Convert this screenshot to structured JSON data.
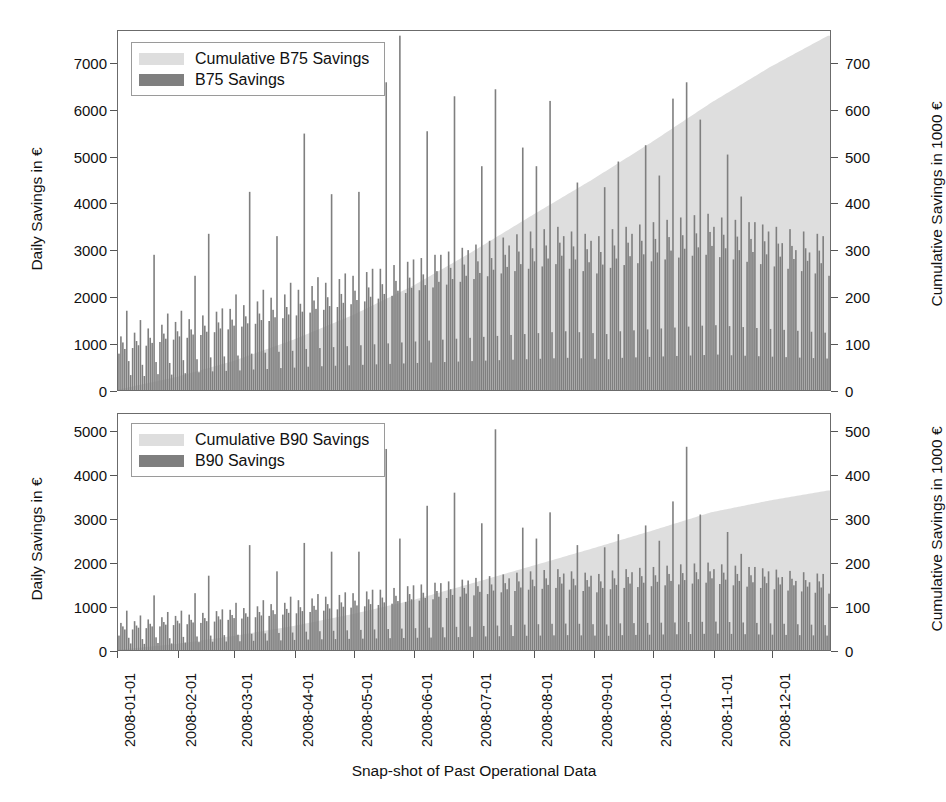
{
  "figure": {
    "width": 937,
    "height": 802,
    "background": "#ffffff",
    "xlabel": "Snap-shot of Past Operational Data"
  },
  "colors": {
    "bar": "#7f7f7f",
    "cumulative_area": "#dedede",
    "frame": "#6b6b6b",
    "text": "#111111"
  },
  "xaxis": {
    "label": "Snap-shot of Past Operational Data",
    "ticks": [
      "2008-01-01",
      "2008-02-01",
      "2008-03-01",
      "2008-04-01",
      "2008-05-01",
      "2008-06-01",
      "2008-07-01",
      "2008-08-01",
      "2008-09-01",
      "2008-10-01",
      "2008-11-01",
      "2008-12-01"
    ],
    "tick_day_offsets": [
      0,
      31,
      60,
      91,
      121,
      152,
      182,
      213,
      244,
      274,
      305,
      335
    ],
    "range_days": [
      0,
      365
    ]
  },
  "panels": [
    {
      "id": "b75",
      "legend": {
        "items": [
          {
            "label": "Cumulative B75 Savings",
            "color": "#dedede",
            "name": "legend-cumulative-b75"
          },
          {
            "label": "B75 Savings",
            "color": "#7f7f7f",
            "name": "legend-b75"
          }
        ]
      },
      "ylabel_left": "Daily Savings in €",
      "ylabel_right": "Cumulative Savings in 1000 €",
      "yticks_left": [
        0,
        1000,
        2000,
        3000,
        4000,
        5000,
        6000,
        7000
      ],
      "yticks_right": [
        0,
        100,
        200,
        300,
        400,
        500,
        600,
        700
      ],
      "ylim_left": [
        0,
        7700
      ],
      "ylim_right": [
        0,
        770
      ]
    },
    {
      "id": "b90",
      "legend": {
        "items": [
          {
            "label": "Cumulative B90 Savings",
            "color": "#dedede",
            "name": "legend-cumulative-b90"
          },
          {
            "label": "B90 Savings",
            "color": "#7f7f7f",
            "name": "legend-b90"
          }
        ]
      },
      "ylabel_left": "Daily Savings in €",
      "ylabel_right": "Cumulative Savings in 1000 €",
      "yticks_left": [
        0,
        1000,
        2000,
        3000,
        4000,
        5000
      ],
      "yticks_right": [
        0,
        100,
        200,
        300,
        400,
        500
      ],
      "ylim_left": [
        0,
        5400
      ],
      "ylim_right": [
        0,
        540
      ]
    }
  ],
  "chart_data": [
    {
      "type": "bar",
      "id": "b75",
      "title": "",
      "xlabel": "Snap-shot of Past Operational Data",
      "ylabel": "Daily Savings in €",
      "ylabel_secondary": "Cumulative Savings in 1000 €",
      "ylim": [
        0,
        7700
      ],
      "ylim_secondary": [
        0,
        770
      ],
      "grid": false,
      "legend_position": "upper left",
      "x_start_date": "2008-01-01",
      "x_end_date": "2008-12-31",
      "n_points": 365,
      "series": [
        {
          "name": "B75 Savings",
          "kind": "bar",
          "color": "#7f7f7f",
          "axis": "left",
          "unit": "€ per day",
          "note": "Daily savings, strong weekly pattern: weekday peaks, weekend troughs. Mean rises from ~900 in January to ~2900 in December.",
          "monthly_mean": [
            950,
            1200,
            1500,
            1750,
            2050,
            2400,
            2550,
            2500,
            2650,
            2800,
            2700,
            2600
          ],
          "monthly_max": [
            2900,
            3400,
            4250,
            5500,
            7600,
            6300,
            6450,
            6200,
            5100,
            6600,
            5050,
            3450
          ],
          "monthly_min": [
            150,
            200,
            250,
            300,
            350,
            400,
            450,
            420,
            450,
            480,
            450,
            420
          ],
          "values": [
            780,
            1150,
            1020,
            880,
            1700,
            620,
            320,
            900,
            1230,
            1050,
            960,
            1500,
            540,
            300,
            950,
            1320,
            1120,
            1010,
            2900,
            600,
            340,
            1030,
            1400,
            1210,
            1100,
            1640,
            580,
            330,
            1080,
            1460,
            1260,
            1150,
            1700,
            640,
            360,
            1120,
            1520,
            1300,
            1190,
            2450,
            660,
            380,
            1180,
            1600,
            1380,
            1250,
            3350,
            700,
            400,
            1240,
            1680,
            1450,
            1320,
            1750,
            720,
            410,
            1300,
            1740,
            1510,
            1380,
            2050,
            740,
            420,
            1360,
            1820,
            1580,
            1430,
            4250,
            780,
            440,
            1420,
            1900,
            1640,
            1500,
            2150,
            800,
            450,
            1480,
            1980,
            1720,
            1560,
            3300,
            820,
            470,
            1540,
            2050,
            1780,
            1620,
            2300,
            840,
            480,
            1600,
            2150,
            1850,
            1680,
            5500,
            880,
            500,
            1660,
            2230,
            1920,
            1740,
            2420,
            900,
            510,
            1720,
            2300,
            1990,
            1800,
            4200,
            920,
            520,
            1780,
            2380,
            2060,
            1870,
            2500,
            940,
            530,
            1840,
            2450,
            2130,
            1930,
            4250,
            960,
            540,
            1900,
            2530,
            2200,
            2000,
            2600,
            980,
            550,
            1960,
            2600,
            2270,
            2060,
            6600,
            1000,
            560,
            2020,
            2680,
            2340,
            2130,
            7600,
            1020,
            570,
            2080,
            2750,
            2410,
            2190,
            2800,
            1040,
            580,
            2140,
            2830,
            2480,
            2250,
            5550,
            1060,
            590,
            2200,
            2900,
            2550,
            2320,
            2900,
            1080,
            600,
            2260,
            2970,
            2620,
            2380,
            6300,
            1100,
            610,
            2320,
            3050,
            2690,
            2450,
            3000,
            1120,
            620,
            2380,
            3120,
            2760,
            2510,
            4800,
            1140,
            630,
            2440,
            3200,
            2830,
            2580,
            6450,
            1160,
            640,
            2500,
            3270,
            2900,
            2640,
            3100,
            1180,
            650,
            2550,
            3340,
            2970,
            2700,
            5200,
            1200,
            660,
            2600,
            3400,
            3040,
            2760,
            4800,
            1220,
            670,
            2650,
            3450,
            3100,
            2820,
            6200,
            1240,
            680,
            2700,
            3500,
            3160,
            2880,
            3300,
            1260,
            690,
            2600,
            3400,
            3080,
            2800,
            4450,
            1240,
            680,
            2550,
            3350,
            3020,
            2740,
            3200,
            1220,
            670,
            2500,
            3300,
            2960,
            2690,
            4350,
            1200,
            660,
            2620,
            3450,
            3100,
            2820,
            4900,
            1260,
            690,
            2680,
            3500,
            3160,
            2870,
            3350,
            1280,
            700,
            2720,
            3550,
            3200,
            2910,
            5250,
            1300,
            710,
            2760,
            3600,
            3240,
            2950,
            4600,
            1320,
            720,
            2800,
            3650,
            3280,
            2990,
            6250,
            1340,
            730,
            2840,
            3700,
            3320,
            3030,
            6600,
            1360,
            740,
            2880,
            3750,
            3360,
            3060,
            5800,
            1380,
            750,
            2900,
            3780,
            3390,
            3090,
            3500,
            1390,
            760,
            2850,
            3700,
            3330,
            3040,
            5050,
            1370,
            745,
            2800,
            3650,
            3290,
            3000,
            4150,
            1350,
            735,
            2750,
            3600,
            3240,
            2960,
            3600,
            1330,
            725,
            2700,
            3550,
            3190,
            2910,
            3400,
            1310,
            715,
            2650,
            3500,
            3140,
            2860,
            3150,
            1290,
            705,
            2600,
            3450,
            3090,
            2810,
            3000,
            1270,
            695,
            2550,
            3400,
            3040,
            2770,
            2950,
            1250,
            685,
            2500,
            3350,
            2990,
            2720,
            3300,
            1230,
            675,
            2450,
            3300,
            2940,
            2680,
            3200
          ]
        },
        {
          "name": "Cumulative B75 Savings",
          "kind": "area",
          "color": "#dedede",
          "axis": "right",
          "unit": "1000 €",
          "note": "Monotonically increasing cumulative sum, ends near 760 thousand €.",
          "monthly_end_values": [
            28,
            62,
            108,
            160,
            223,
            295,
            374,
            451,
            530,
            616,
            692,
            760
          ]
        }
      ]
    },
    {
      "type": "bar",
      "id": "b90",
      "title": "",
      "xlabel": "Snap-shot of Past Operational Data",
      "ylabel": "Daily Savings in €",
      "ylabel_secondary": "Cumulative Savings in 1000 €",
      "ylim": [
        0,
        5400
      ],
      "ylim_secondary": [
        0,
        540
      ],
      "grid": false,
      "legend_position": "upper left",
      "x_start_date": "2008-01-01",
      "x_end_date": "2008-12-31",
      "n_points": 365,
      "series": [
        {
          "name": "B90 Savings",
          "kind": "bar",
          "color": "#7f7f7f",
          "axis": "left",
          "unit": "€ per day",
          "note": "Daily savings with the same weekly pattern as B75 but roughly 60% of the magnitude.",
          "monthly_mean": [
            480,
            620,
            780,
            900,
            1050,
            1250,
            1300,
            1280,
            1350,
            1430,
            1380,
            1320
          ],
          "monthly_max": [
            1250,
            1700,
            2400,
            2450,
            4600,
            3600,
            5050,
            3150,
            3400,
            4650,
            2700,
            2400
          ],
          "monthly_min": [
            90,
            110,
            140,
            170,
            200,
            230,
            250,
            240,
            250,
            270,
            260,
            240
          ],
          "values": [
            330,
            620,
            540,
            470,
            900,
            280,
            150,
            470,
            660,
            560,
            510,
            790,
            250,
            140,
            500,
            700,
            600,
            540,
            1250,
            290,
            160,
            540,
            750,
            640,
            580,
            870,
            270,
            150,
            570,
            780,
            670,
            610,
            900,
            300,
            170,
            590,
            810,
            690,
            630,
            1300,
            310,
            180,
            620,
            850,
            730,
            660,
            1700,
            330,
            190,
            650,
            890,
            770,
            700,
            930,
            340,
            195,
            690,
            920,
            800,
            730,
            1080,
            350,
            200,
            720,
            960,
            840,
            760,
            2400,
            370,
            210,
            750,
            1000,
            870,
            790,
            1140,
            380,
            215,
            780,
            1050,
            910,
            820,
            1800,
            390,
            220,
            810,
            1080,
            940,
            850,
            1220,
            400,
            230,
            840,
            1140,
            980,
            890,
            2450,
            420,
            240,
            870,
            1180,
            1010,
            920,
            1280,
            430,
            245,
            900,
            1220,
            1050,
            950,
            2250,
            440,
            250,
            930,
            1260,
            1090,
            990,
            1320,
            450,
            255,
            970,
            1300,
            1130,
            1020,
            2250,
            460,
            260,
            1000,
            1340,
            1160,
            1050,
            1380,
            470,
            265,
            1030,
            1380,
            1200,
            1090,
            4600,
            480,
            270,
            1060,
            1420,
            1240,
            1120,
            2550,
            490,
            275,
            1100,
            1460,
            1280,
            1160,
            1480,
            500,
            280,
            1130,
            1500,
            1310,
            1190,
            3300,
            510,
            285,
            1160,
            1540,
            1350,
            1220,
            1530,
            520,
            290,
            1190,
            1570,
            1390,
            1260,
            3600,
            530,
            295,
            1220,
            1610,
            1420,
            1290,
            1590,
            540,
            300,
            1250,
            1650,
            1460,
            1330,
            2900,
            550,
            310,
            1280,
            1690,
            1500,
            1360,
            5050,
            560,
            315,
            1320,
            1730,
            1530,
            1390,
            1640,
            570,
            320,
            1350,
            1770,
            1570,
            1430,
            2800,
            580,
            325,
            1380,
            1800,
            1610,
            1460,
            2550,
            590,
            330,
            1400,
            1830,
            1640,
            1490,
            3150,
            600,
            335,
            1420,
            1850,
            1670,
            1520,
            1750,
            605,
            340,
            1380,
            1800,
            1630,
            1480,
            2400,
            600,
            335,
            1350,
            1770,
            1600,
            1450,
            1700,
            590,
            330,
            1320,
            1740,
            1570,
            1420,
            2350,
            585,
            325,
            1390,
            1820,
            1640,
            1490,
            2650,
            610,
            340,
            1420,
            1850,
            1670,
            1520,
            1780,
            615,
            345,
            1440,
            1880,
            1690,
            1540,
            2850,
            620,
            350,
            1460,
            1900,
            1710,
            1560,
            2500,
            625,
            355,
            1480,
            1930,
            1740,
            1580,
            3400,
            630,
            360,
            1500,
            1960,
            1760,
            1600,
            4650,
            640,
            365,
            1520,
            1980,
            1780,
            1620,
            3100,
            645,
            370,
            1540,
            2000,
            1800,
            1640,
            1850,
            650,
            375,
            1510,
            1960,
            1770,
            1610,
            2700,
            640,
            368,
            1480,
            1930,
            1740,
            1580,
            2200,
            630,
            362,
            1450,
            1900,
            1710,
            1550,
            1900,
            620,
            356,
            1420,
            1870,
            1680,
            1530,
            1800,
            610,
            350,
            1390,
            1840,
            1660,
            1500,
            1670,
            600,
            345,
            1360,
            1810,
            1630,
            1480,
            1580,
            590,
            340,
            1340,
            1780,
            1600,
            1450,
            1550,
            580,
            335,
            1310,
            1750,
            1570,
            1430,
            1740,
            570,
            330,
            1290,
            1720,
            1540,
            1400,
            2400
          ]
        },
        {
          "name": "Cumulative B90 Savings",
          "kind": "area",
          "color": "#dedede",
          "axis": "right",
          "unit": "1000 €",
          "note": "Monotonically increasing cumulative sum, ends near 365 thousand €.",
          "monthly_end_values": [
            14,
            32,
            55,
            82,
            114,
            152,
            192,
            232,
            272,
            315,
            342,
            365
          ]
        }
      ]
    }
  ]
}
